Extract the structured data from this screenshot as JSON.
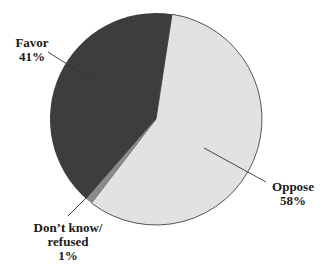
{
  "chart_data": {
    "type": "pie",
    "title": "",
    "slices": [
      {
        "label": "Favor",
        "value": 41,
        "display": "41%",
        "color": "#3d3d3d"
      },
      {
        "label": "Oppose",
        "value": 58,
        "display": "58%",
        "color": "#e2e2e2"
      },
      {
        "label": "Don't know/ refused",
        "value": 1,
        "display": "1%",
        "color": "#8a8a8a"
      }
    ],
    "start_angle_deg_clockwise_from_top": 8.7,
    "order": [
      "Oppose",
      "Don't know/ refused",
      "Favor"
    ],
    "legend": "none (direct labels with leader lines)"
  },
  "labels": {
    "favor": {
      "name": "Favor",
      "pct": "41%"
    },
    "oppose": {
      "name": "Oppose",
      "pct": "58%"
    },
    "dontknow": {
      "line1": "Don’t know/",
      "line2": "refused",
      "pct": "1%"
    }
  },
  "geometry": {
    "cx": 156,
    "cy": 119,
    "r": 106
  }
}
